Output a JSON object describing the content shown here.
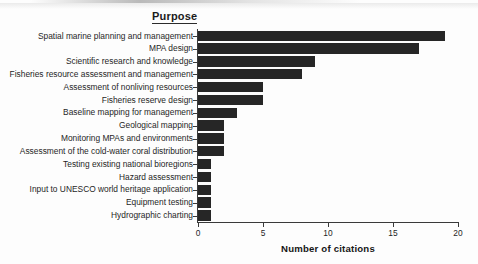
{
  "chart_data": {
    "type": "bar",
    "orientation": "horizontal",
    "title": "Purpose",
    "xlabel": "Number of citations",
    "ylabel": "",
    "xlim": [
      0,
      20
    ],
    "xticks": [
      0,
      5,
      10,
      15,
      20
    ],
    "grid": false,
    "legend": null,
    "bar_color": "#262626",
    "categories": [
      "Spatial marine planning and management",
      "MPA design",
      "Scientific research and knowledge",
      "Fisheries resource assessment and management",
      "Assessment of nonliving resources",
      "Fisheries reserve design",
      "Baseline mapping for management",
      "Geological mapping",
      "Monitoring MPAs and environments",
      "Assessment of the cold-water coral distribution",
      "Testing existing national bioregions",
      "Hazard assessment",
      "Input to UNESCO world heritage application",
      "Equipment testing",
      "Hydrographic charting"
    ],
    "values": [
      19,
      17,
      9,
      8,
      5,
      5,
      3,
      2,
      2,
      2,
      1,
      1,
      1,
      1,
      1
    ]
  }
}
